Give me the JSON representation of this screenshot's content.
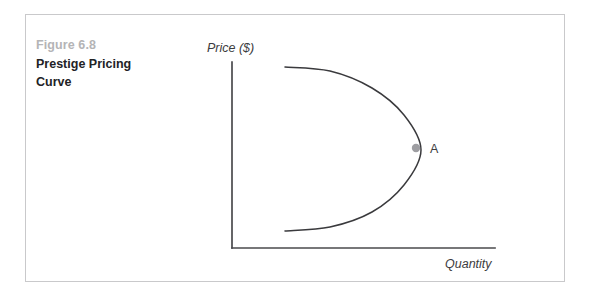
{
  "figure": {
    "number_label": "Figure 6.8",
    "title": "Prestige Pricing Curve",
    "frame_color": "#c9c9cb",
    "background": "#ffffff"
  },
  "chart_data": {
    "type": "line",
    "title": "Prestige Pricing Curve",
    "xlabel": "Quantity",
    "ylabel": "Price ($)",
    "grid": false,
    "legend": null,
    "axis_color": "#4a4a4d",
    "curve_color": "#3a3a3d",
    "x_axis_ticks": [],
    "y_axis_ticks": [],
    "series": [
      {
        "name": "Prestige pricing demand curve",
        "description": "Backward-C shaped curve: demand rises with price up to a point, then falls",
        "points": [
          {
            "x": 285,
            "y": 67
          },
          {
            "x": 330,
            "y": 71
          },
          {
            "x": 372,
            "y": 88
          },
          {
            "x": 404,
            "y": 115
          },
          {
            "x": 421,
            "y": 150
          },
          {
            "x": 404,
            "y": 185
          },
          {
            "x": 372,
            "y": 212
          },
          {
            "x": 330,
            "y": 227
          },
          {
            "x": 285,
            "y": 231
          }
        ]
      }
    ],
    "annotations": [
      {
        "label": "A",
        "marker": "filled-circle",
        "marker_color": "#9e9ea2",
        "x": 416,
        "y": 148,
        "label_x": 430,
        "label_y": 153
      }
    ],
    "axes": {
      "y_axis": {
        "x": 232,
        "y_top": 62,
        "y_bottom": 248
      },
      "x_axis": {
        "y": 248,
        "x_left": 232,
        "x_right": 495
      }
    }
  },
  "labels": {
    "y_axis_label": "Price ($)",
    "y_axis_label_x": 207,
    "y_axis_label_y": 52,
    "x_axis_label": "Quantity",
    "x_axis_label_x": 445,
    "x_axis_label_y": 268,
    "point_a": "A"
  }
}
